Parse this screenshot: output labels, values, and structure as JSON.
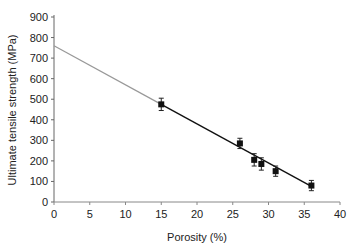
{
  "chart_data": {
    "type": "scatter",
    "title": "",
    "xlabel": "Porosity (%)",
    "ylabel": "Ultimate tensile strength (MPa)",
    "xlim": [
      0,
      40
    ],
    "ylim": [
      0,
      900
    ],
    "xticks": [
      0,
      5,
      10,
      15,
      20,
      25,
      30,
      35,
      40
    ],
    "yticks": [
      0,
      100,
      200,
      300,
      400,
      500,
      600,
      700,
      800,
      900
    ],
    "grid": false,
    "legend": null,
    "series": [
      {
        "name": "Measured",
        "marker": "square",
        "x": [
          15,
          26,
          28,
          29,
          31,
          36
        ],
        "y": [
          475,
          285,
          205,
          185,
          150,
          80
        ],
        "yerr": [
          30,
          25,
          30,
          30,
          25,
          25
        ]
      }
    ],
    "fit_line": {
      "type": "linear",
      "intercept": 760,
      "slope": -19.0,
      "extrapolated_range": [
        0,
        15
      ],
      "data_range": [
        15,
        36
      ]
    }
  }
}
